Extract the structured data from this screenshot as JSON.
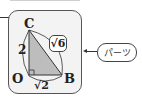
{
  "figure": {
    "vertices": {
      "C": "C",
      "O": "O",
      "B": "B"
    },
    "side_labels": {
      "OC": "2",
      "OB": "√2",
      "CB": "√6"
    },
    "right_angle_at": "O",
    "triangle_fill": "#bdbdbd"
  },
  "callout": {
    "label": "パーツ"
  }
}
